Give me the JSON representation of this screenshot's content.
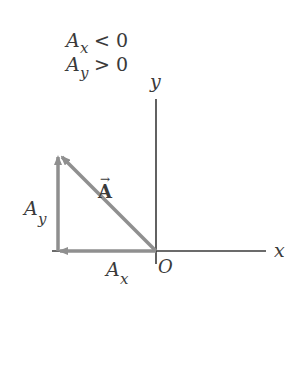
{
  "diagram": {
    "conditions": [
      {
        "symbol": "A",
        "sub": "x",
        "relation": "< 0"
      },
      {
        "symbol": "A",
        "sub": "y",
        "relation": "> 0"
      }
    ],
    "axes": {
      "x_label": "x",
      "y_label": "y",
      "origin_label": "O"
    },
    "vectors": {
      "main": {
        "label": "A",
        "arrow_over": "→"
      },
      "x_component": {
        "symbol": "A",
        "sub": "x"
      },
      "y_component": {
        "symbol": "A",
        "sub": "y"
      }
    },
    "colors": {
      "axis": "#3a3a3a",
      "vector": "#8f8f8f",
      "text": "#3a3a3a"
    }
  }
}
